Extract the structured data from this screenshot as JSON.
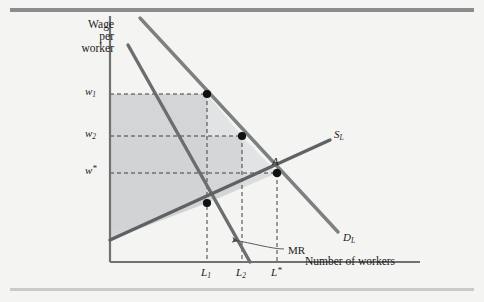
{
  "figure": {
    "background_color": "#f4f4f3",
    "top_rule_color": "#8a8d8e",
    "bottom_rule_color": "#c9cbcb"
  },
  "axes": {
    "y_title_line1": "Wage",
    "y_title_line2": "per",
    "y_title_line3": "worker",
    "x_title": "Number of workers",
    "axis_color": "#6f7273"
  },
  "y_ticks": [
    {
      "name": "w1",
      "base": "w",
      "sub": "1",
      "star": "",
      "label": "w₁",
      "y_px": 94
    },
    {
      "name": "w2",
      "base": "w",
      "sub": "2",
      "star": "",
      "label": "w₂",
      "y_px": 136
    },
    {
      "name": "wstar",
      "base": "w",
      "sub": "",
      "star": "*",
      "label": "w*",
      "y_px": 173
    }
  ],
  "x_ticks": [
    {
      "name": "L1",
      "base": "L",
      "sub": "1",
      "star": "",
      "label": "L₁",
      "x_px": 207
    },
    {
      "name": "L2",
      "base": "L",
      "sub": "2",
      "star": "",
      "label": "L₂",
      "x_px": 242
    },
    {
      "name": "Lstar",
      "base": "L",
      "sub": "",
      "star": "*",
      "label": "L*",
      "x_px": 277
    }
  ],
  "curves": [
    {
      "name": "supply",
      "label": "S",
      "sub": "L",
      "color": "#6b6e6f",
      "x1": 110,
      "y1": 240,
      "x2": 330,
      "y2": 140
    },
    {
      "name": "demand",
      "label": "D",
      "sub": "L",
      "color": "#7d8081",
      "x1": 140,
      "y1": 18,
      "x2": 338,
      "y2": 232
    },
    {
      "name": "marginal-revenue",
      "label": "MR",
      "sub": "",
      "color": "#6b6e6f",
      "x1": 128,
      "y1": 45,
      "x2": 250,
      "y2": 262
    }
  ],
  "points": [
    {
      "name": "point-w1-L1",
      "x": 207,
      "y": 94,
      "label": ""
    },
    {
      "name": "point-w2-L2",
      "x": 242,
      "y": 136,
      "label": ""
    },
    {
      "name": "point-A",
      "x": 277,
      "y": 173,
      "label": "A"
    },
    {
      "name": "point-mr-supply",
      "x": 207,
      "y": 203,
      "label": ""
    }
  ],
  "annotations": {
    "mr_label": "MR",
    "mr_label_x": 288,
    "mr_label_y": 252,
    "point_a_label": "A",
    "shade_color_outer": "#d9dadb",
    "shade_color_inner": "#cfd1d2"
  }
}
